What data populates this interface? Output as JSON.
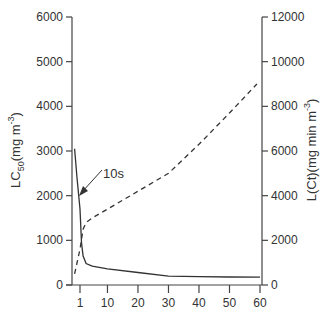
{
  "chart_data": {
    "type": "line",
    "title": "",
    "xlabel": "",
    "x_ticks": [
      1,
      10,
      20,
      30,
      40,
      50,
      60
    ],
    "xlim": [
      0,
      60
    ],
    "y_left": {
      "label_main": "LC",
      "label_sub": "50",
      "label_rest": "(mg m",
      "label_sup": "-3",
      "label_end": ")",
      "ticks": [
        0,
        1000,
        2000,
        3000,
        4000,
        5000,
        6000
      ],
      "lim": [
        0,
        6000
      ]
    },
    "y_right": {
      "label_main": "L(Ct)(mg min m",
      "label_sup": "-3",
      "label_end": ")",
      "ticks": [
        0,
        2000,
        4000,
        6000,
        8000,
        10000,
        12000
      ],
      "lim": [
        0,
        12000
      ]
    },
    "series": [
      {
        "name": "LC50",
        "axis": "left",
        "style": "solid",
        "x": [
          0.1,
          0.5,
          1,
          1.5,
          2,
          3,
          5,
          10,
          20,
          30,
          40,
          50,
          60
        ],
        "y": [
          3050,
          2400,
          1700,
          950,
          650,
          480,
          420,
          360,
          280,
          200,
          185,
          180,
          175
        ]
      },
      {
        "name": "L(Ct)",
        "axis": "right",
        "style": "dashed",
        "x": [
          0.1,
          1,
          2,
          3,
          5,
          10,
          20,
          30,
          40,
          50,
          59
        ],
        "y": [
          500,
          1600,
          2500,
          2800,
          3000,
          3400,
          4200,
          5000,
          6300,
          7700,
          9000
        ]
      }
    ],
    "annotations": [
      {
        "text": "10s",
        "arrow_to_x": 0.2,
        "arrow_to_y": 2000
      }
    ],
    "grid": false,
    "legend": "none"
  }
}
